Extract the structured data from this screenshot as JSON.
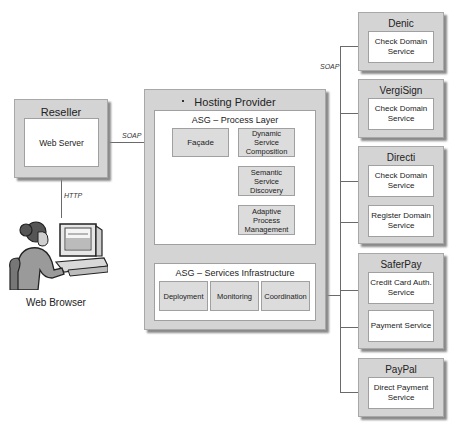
{
  "reseller": {
    "title": "Reseller",
    "web_server": "Web Server"
  },
  "web_browser": {
    "label": "Web Browser"
  },
  "hosting_provider": {
    "title": "Hosting Provider",
    "process_layer": {
      "title": "ASG – Process Layer",
      "facade": "Façade",
      "dynamic_composition": "Dynamic Service Composition",
      "semantic_discovery": "Semantic Service Discovery",
      "adaptive_management": "Adaptive Process Management"
    },
    "services_infrastructure": {
      "title": "ASG – Services Infrastructure",
      "modules": [
        "Deployment",
        "Monitoring",
        "Coordination"
      ]
    }
  },
  "connections": {
    "reseller_to_facade": "SOAP",
    "reseller_to_browser": "HTTP",
    "process_to_infra": "SOAP",
    "infra_to_providers": "SOAP"
  },
  "providers": [
    {
      "name": "Denic",
      "services": [
        "Check Domain Service"
      ]
    },
    {
      "name": "VergiSign",
      "services": [
        "Check Domain Service"
      ]
    },
    {
      "name": "Directi",
      "services": [
        "Check Domain Service",
        "Register Domain Service"
      ]
    },
    {
      "name": "SaferPay",
      "services": [
        "Credit Card Auth. Service",
        "Payment Service"
      ]
    },
    {
      "name": "PayPal",
      "services": [
        "Direct Payment Service"
      ]
    }
  ]
}
